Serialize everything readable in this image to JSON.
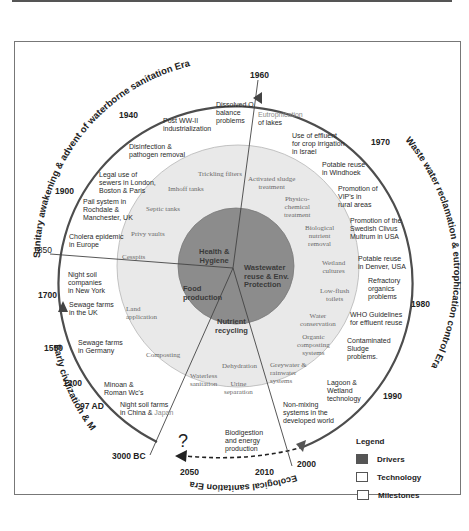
{
  "diagram": {
    "eras": [
      {
        "id": "sanitary",
        "label": "Sanitary awakening & advent of waterborne sanitation Era"
      },
      {
        "id": "wastewater",
        "label": "Waste water reclamation & eutrophication control Era"
      },
      {
        "id": "ecological",
        "label": "Ecological sanitation Era"
      },
      {
        "id": "early",
        "label": "Early civilization & Middle Ages Era"
      }
    ],
    "years": {
      "y1960": "1960",
      "y1940": "1940",
      "y1970": "1970",
      "y1900": "1900",
      "y1850": "1850",
      "y1700": "1700",
      "y1550": "1550",
      "y1200": "1200",
      "y97ad": "97 AD",
      "y3000bc": "3000 BC",
      "y1980": "1980",
      "y1990": "1990",
      "y2000": "2000",
      "y2010": "2010",
      "y2050": "2050"
    },
    "question_mark": "?",
    "drivers": {
      "health": "Health &\nHygiene",
      "wastewater": "Wastewater\nreuse & Env.\nProtection",
      "food": "Food\nproduction",
      "nutrient": "Nutrient\nrecycling"
    },
    "technology": {
      "trickling": "Trickling filters",
      "imhoff": "Imhoff tanks",
      "septic": "Septic tanks",
      "privy": "Privy vaults",
      "cesspits": "Cesspits",
      "land": "Land\napplication",
      "composting": "Composting",
      "waterless": "Waterless\nsanitation",
      "dehydration": "Dehydration",
      "urine": "Urine\nseparation",
      "greywater": "Greywater &\nrainwater\nsystems",
      "organic": "Organic\ncomposting\nsystems",
      "waterconservation": "Water\nconservation",
      "lowflush": "Low-flush\ntoilets",
      "wetland": "Wetland\ncultures",
      "bnr": "Biological\nnutrient\nremoval",
      "physico": "Physico-\nchemical\ntreatment",
      "activated": "Activated sludge\ntreatment"
    },
    "milestones": {
      "dissolved": "Dissolved O\nbalance\nproblems",
      "postww2": "Post WW-II\nindustrialization",
      "disinfection": "Disinfection &\npathogen removal",
      "legal": "Legal use of\nsewers in London,\nBoston & Paris",
      "pail": "Pail system in\nRochdale &\nManchester, UK",
      "cholera": "Cholera epidemic\nin Europe",
      "nightsoil_ny": "Night soil\ncompanies\nin New York",
      "sewage_uk": "Sewage farms\nin the UK",
      "sewage_de": "Sewage farms\nin Germany",
      "minoan": "Minoan &\nRoman Wc's",
      "nightsoil_cn": "Night soil farms\nin China & ",
      "nightsoil_cn_jp": "Japan",
      "eutroph_1": "Eutrophication",
      "eutroph_2": "of lakes",
      "crop": "Use of effluent\nfor crop irrigation\nin Israel",
      "windhoek": "Potable reuse\nin Windhoek",
      "vip": "Promotion of\nVIP's in\nrural areas",
      "clivus": "Promotion of the\nSwedish Clivus\nMultrum in USA",
      "denver": "Potable reuse\nin Denver, USA",
      "refractory": "Refractory\norganics\nproblems",
      "who": "WHO Guidelines\nfor effluent reuse",
      "sludge": "Contaminated\nSludge\nproblems.",
      "lagoon": "Lagoon &\nWetland\ntechnology",
      "nonmixing": "Non-mixing\nsystems in the\ndeveloped world",
      "biodigestion": "Biodigestion\nand energy\nproduction"
    },
    "legend": {
      "title": "Legend",
      "items": [
        {
          "label": "Drivers",
          "swatch": "#555555"
        },
        {
          "label": "Technology",
          "swatch": "#ffffff"
        },
        {
          "label": "Milestones",
          "swatch": "#ffffff"
        }
      ]
    },
    "colors": {
      "outer_arc": "#555555",
      "tech_ring": "#e9e9e9",
      "driver_disk": "#8c8c8c",
      "frame": "#777777"
    }
  }
}
